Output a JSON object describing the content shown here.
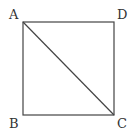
{
  "diagram": {
    "type": "geometry",
    "shape": "square",
    "vertices": [
      {
        "label": "A",
        "x": 23,
        "y": 22
      },
      {
        "label": "D",
        "x": 114,
        "y": 22
      },
      {
        "label": "C",
        "x": 114,
        "y": 115
      },
      {
        "label": "B",
        "x": 23,
        "y": 115
      }
    ],
    "segments": [
      {
        "from": "A",
        "to": "D"
      },
      {
        "from": "D",
        "to": "C"
      },
      {
        "from": "C",
        "to": "B"
      },
      {
        "from": "B",
        "to": "A"
      },
      {
        "from": "A",
        "to": "C",
        "kind": "diagonal"
      }
    ],
    "labels": {
      "a": "A",
      "b": "B",
      "c": "C",
      "d": "D"
    },
    "stroke_color": "#444444"
  }
}
